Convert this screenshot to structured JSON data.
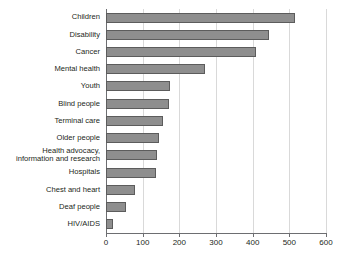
{
  "chart_data": {
    "type": "bar",
    "orientation": "horizontal",
    "title": "",
    "subtitle": "",
    "xlabel": "",
    "ylabel": "",
    "xlim": [
      0,
      600
    ],
    "ylim": null,
    "xticks": [
      0,
      100,
      200,
      300,
      400,
      500,
      600
    ],
    "xtick_labels": [
      "0",
      "100",
      "200",
      "300",
      "400",
      "500",
      "600"
    ],
    "grid": "vertical",
    "legend": null,
    "legend_position": "none",
    "categories": [
      "Children",
      "Disability",
      "Cancer",
      "Mental health",
      "Youth",
      "Blind people",
      "Terminal care",
      "Older people",
      "Health advocacy,\ninformation and research",
      "Hospitals",
      "Chest and heart",
      "Deaf people",
      "HIV/AIDS"
    ],
    "values": [
      515,
      445,
      409,
      270,
      175,
      172,
      155,
      145,
      139,
      136,
      79,
      55,
      20
    ],
    "bar_color": "#8e8e8e",
    "bar_border_color": "#5c5c5c",
    "gridline_color": "#d9d9d9",
    "axis_color": "#6d6e71",
    "text_color": "#231f20",
    "background_color": "#ffffff"
  }
}
